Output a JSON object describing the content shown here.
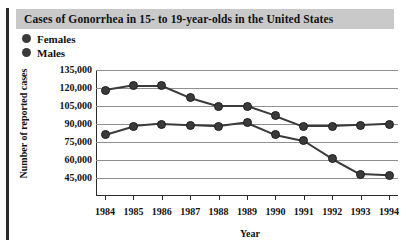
{
  "chart_data": {
    "type": "line",
    "title": "Cases of Gonorrhea in 15- to 19-year-olds in the United States",
    "xlabel": "Year",
    "ylabel": "Number of reported cases",
    "categories": [
      "1984",
      "1985",
      "1986",
      "1987",
      "1988",
      "1989",
      "1990",
      "1991",
      "1992",
      "1993",
      "1994"
    ],
    "series": [
      {
        "name": "Females",
        "color": "#3a3a3a",
        "values": [
          118000,
          122000,
          122000,
          112000,
          105000,
          105000,
          97000,
          88000,
          88000,
          89000,
          90000
        ]
      },
      {
        "name": "Males",
        "color": "#3a3a3a",
        "values": [
          81000,
          88000,
          90000,
          89000,
          88000,
          91000,
          81000,
          76000,
          61000,
          48000,
          47000
        ]
      }
    ],
    "ylim": [
      37500,
      135000
    ],
    "yticks": [
      135000,
      120000,
      105000,
      90000,
      75000,
      60000,
      45000
    ],
    "ytick_labels": [
      "135,000",
      "120,000",
      "105,000",
      "90,000",
      "75,000",
      "60,000",
      "45,000"
    ],
    "grid": true,
    "legend_position": "top-left"
  },
  "legend": {
    "items": [
      {
        "label": "Females"
      },
      {
        "label": "Males"
      }
    ]
  },
  "icons": {
    "female_marker": "filled-circle-marker",
    "male_marker": "filled-circle-marker"
  },
  "colors": {
    "title_band": "#c9c9c9",
    "marker": "#3a3a3a",
    "line": "#1d1d1d",
    "gridline": "#8f8f8f",
    "axis": "#2b2b2b",
    "background": "#ffffff"
  }
}
